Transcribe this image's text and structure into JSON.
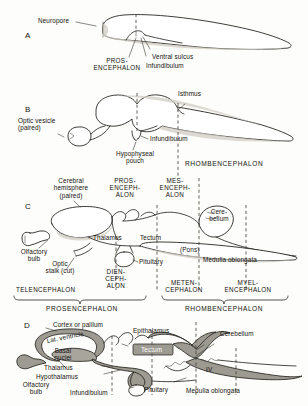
{
  "figure": {
    "panels": [
      "A",
      "B",
      "C",
      "D"
    ]
  },
  "panel_a": {
    "letter": "A",
    "labels": {
      "neuropore": "Neuropore",
      "prosencephalon": "PROS-\nENCEPHALON",
      "ventral_sulcus": "Ventral sulcus",
      "infundibulum": "Infundibulum"
    }
  },
  "panel_b": {
    "letter": "B",
    "labels": {
      "isthmus": "Isthmus",
      "optic_vesicle": "Optic vesicle\n(paired)",
      "hypophyseal_pouch": "Hypophyseal\npouch",
      "infundibulum": "Infundibulum",
      "rhombencephalon": "RHOMBENCEPHALON"
    }
  },
  "panel_c": {
    "letter": "C",
    "labels": {
      "cerebral_hemisphere": "Cerebral\nhemisphere\n(paired)",
      "prosencephalon": "PROS-\nENCEPH-\nALON",
      "mesencephalon": "MES-\nENCEPH-\nALON",
      "cerebellum": "Cere-\nbellum",
      "olfactory_bulb": "Olfactory\nbulb",
      "thalamus": "Thalamus",
      "tectum": "Tectum",
      "pons": "(Pons)",
      "medulla_oblongata": "Medulla oblongata",
      "optic_stalk": "Optic\nstalk (cut)",
      "pituitary": "Pituitary",
      "diencephalon": "DIEN-\nCEPH-\nALON",
      "telencephalon": "TELENCEPHALON",
      "metencephalon": "METEN-\nCEPHALON",
      "myelencephalon": "MYEL-\nENCEPHALON",
      "prosencephalon_bracket": "PROSENCEPHALON",
      "rhombencephalon_bracket": "RHOMBENCEPHALON"
    }
  },
  "panel_d": {
    "letter": "D",
    "labels": {
      "cortex_or_pallium": "Cortex or pallium",
      "lateral_ventricle": "Lat. ventricle",
      "basal_nuclei": "Basal\nnuclei",
      "epithalamus": "Epithalamus",
      "tectum": "Tectum",
      "cerebellum": "Cerebellum",
      "thalamus": "Thalamus",
      "hypothalamus": "Hypothalamus",
      "olfactory_bulb": "Olfactory\nbulb",
      "infundibulum": "Infundibulum",
      "pituitary": "Pituitary",
      "fourth_ventricle": "IV",
      "medulla_oblongata": "Medulla oblongata"
    }
  },
  "colors": {
    "ink": "#1b1a15",
    "shade_gray": "#9d9a92",
    "paper": "#fdfdfb",
    "dash_gray": "#4a483f"
  }
}
